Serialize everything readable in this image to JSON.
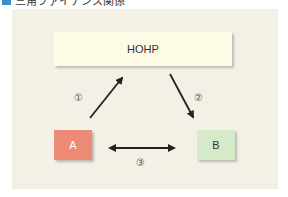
{
  "title": {
    "icon": "blue-square-icon",
    "text": "三角ファイナンス関係"
  },
  "diagram": {
    "nodes": {
      "top": {
        "label": "HOHP",
        "color": "#fdfae6"
      },
      "a": {
        "label": "A",
        "color": "#ee8b76"
      },
      "b": {
        "label": "B",
        "color": "#d4eac8"
      }
    },
    "edges": [
      {
        "from": "A",
        "to": "HOHP",
        "label": "①",
        "direction": "one-way"
      },
      {
        "from": "HOHP",
        "to": "B",
        "label": "②",
        "direction": "one-way"
      },
      {
        "from": "A",
        "to": "B",
        "label": "③",
        "direction": "two-way"
      }
    ],
    "background": "#f3f0e6"
  }
}
